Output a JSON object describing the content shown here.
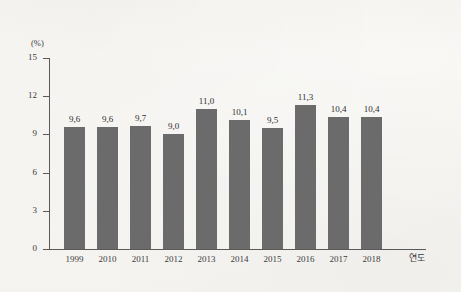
{
  "chart_data": {
    "type": "bar",
    "title": "",
    "subtitle": "",
    "xlabel": "연도",
    "ylabel": "(%)",
    "categories": [
      "1999",
      "2010",
      "2011",
      "2012",
      "2013",
      "2014",
      "2015",
      "2016",
      "2017",
      "2018"
    ],
    "values": [
      9.6,
      9.6,
      9.7,
      9.0,
      11.0,
      10.1,
      9.5,
      11.3,
      10.4,
      10.4
    ],
    "value_labels": [
      "9,6",
      "9,6",
      "9,7",
      "9,0",
      "11,0",
      "10,1",
      "9,5",
      "11,3",
      "10,4",
      "10,4"
    ],
    "ylim": [
      0,
      15
    ],
    "yticks": [
      0,
      3,
      6,
      9,
      12,
      15
    ],
    "ytick_labels": [
      "0",
      "3",
      "6",
      "9",
      "12",
      "15"
    ],
    "grid": false,
    "legend": false,
    "bar_color": "#6b6b6b",
    "axis_color": "#5a5a5a",
    "background_color": "#f7f6f3"
  }
}
